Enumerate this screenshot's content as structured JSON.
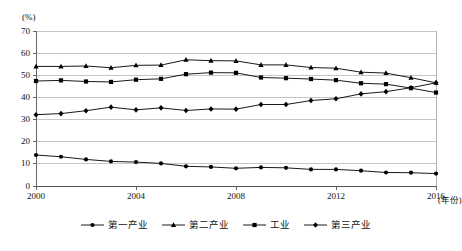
{
  "chart_data": {
    "type": "line",
    "title": "",
    "subtitle": "",
    "xlabel": "(年份)",
    "ylabel": "(%)",
    "x": [
      2000,
      2001,
      2002,
      2003,
      2004,
      2005,
      2006,
      2007,
      2008,
      2009,
      2010,
      2011,
      2012,
      2013,
      2014,
      2015,
      2016
    ],
    "xlim": [
      2000,
      2016
    ],
    "ylim": [
      0,
      70
    ],
    "yticks": [
      0,
      10,
      20,
      30,
      40,
      50,
      60,
      70
    ],
    "xticks": [
      2000,
      2004,
      2008,
      2012,
      2016
    ],
    "xtick_labels": [
      "2000",
      "2004",
      "2008",
      "2012",
      "2016"
    ],
    "ytick_labels": [
      "0",
      "10",
      "20",
      "30",
      "40",
      "50",
      "60",
      "70"
    ],
    "grid": true,
    "grid_axis": "y",
    "legend_position": "bottom",
    "series": [
      {
        "name": "第一产业",
        "marker": "circle",
        "color": "#000000",
        "values": [
          14.0,
          13.2,
          12.0,
          11.1,
          10.8,
          10.2,
          8.9,
          8.6,
          8.0,
          8.4,
          8.2,
          7.5,
          7.5,
          6.9,
          6.1,
          6.0,
          5.6
        ]
      },
      {
        "name": "第二产业",
        "marker": "triangle",
        "color": "#000000",
        "values": [
          54.0,
          54.0,
          54.2,
          53.4,
          54.5,
          54.6,
          57.0,
          56.6,
          56.5,
          54.7,
          54.7,
          53.5,
          53.2,
          51.4,
          51.0,
          48.9,
          46.6
        ]
      },
      {
        "name": "工业",
        "marker": "square",
        "color": "#000000",
        "values": [
          47.4,
          47.7,
          47.2,
          47.0,
          48.0,
          48.4,
          50.5,
          51.2,
          51.1,
          49.0,
          48.7,
          48.3,
          47.8,
          46.4,
          46.0,
          44.2,
          42.2
        ]
      },
      {
        "name": "第三产业",
        "marker": "diamond",
        "color": "#000000",
        "values": [
          32.2,
          32.7,
          34.0,
          35.6,
          34.4,
          35.3,
          34.1,
          34.8,
          34.7,
          36.8,
          36.8,
          38.6,
          39.4,
          41.6,
          42.6,
          44.4,
          46.6
        ]
      }
    ]
  },
  "axis": {
    "unit_label": "(%)",
    "x_axis_title": "(年份)"
  },
  "legend": {
    "items": [
      {
        "label": "第一产业",
        "marker": "circle"
      },
      {
        "label": "第二产业",
        "marker": "triangle"
      },
      {
        "label": "工业",
        "marker": "square"
      },
      {
        "label": "第三产业",
        "marker": "diamond"
      }
    ]
  }
}
